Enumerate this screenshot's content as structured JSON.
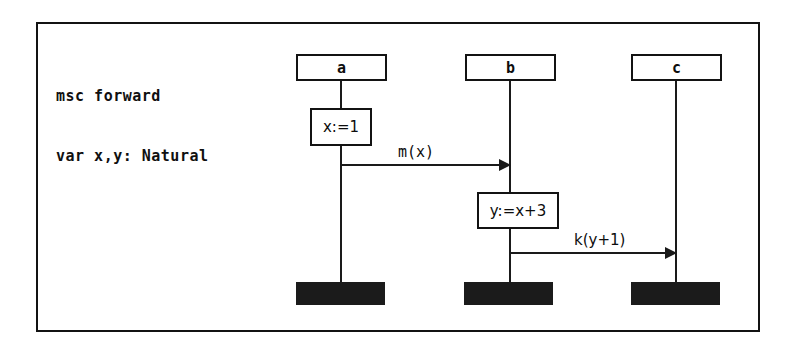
{
  "diagram": {
    "header_lines": [
      "msc forward",
      "var x,y: Natural"
    ],
    "frame_label": "msc-frame",
    "instances": [
      {
        "name": "a",
        "label": "a"
      },
      {
        "name": "b",
        "label": "b"
      },
      {
        "name": "c",
        "label": "c"
      }
    ],
    "actions": [
      {
        "instance": "a",
        "label": "x:=1"
      },
      {
        "instance": "b",
        "label": "y:=x+3"
      }
    ],
    "messages": [
      {
        "label": "m(x)",
        "from": "a",
        "to": "b"
      },
      {
        "label": "k(y+1)",
        "from": "b",
        "to": "c"
      }
    ],
    "colors": {
      "line": "#1a1a1a",
      "fill": "#ffffff",
      "end_bar": "#1b1b1b",
      "background": "#ffffff"
    }
  }
}
